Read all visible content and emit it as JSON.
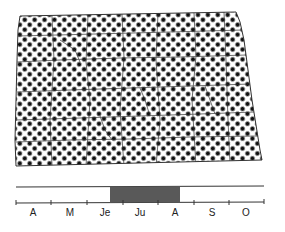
{
  "figure": {
    "type": "range-map",
    "region": "North Dakota (county outlines)",
    "map_fill_pattern": "halftone-dots",
    "colors": {
      "dot": "#111111",
      "background": "#ffffff",
      "outline": "#333333",
      "bar_fill": "#595959",
      "timeline_line": "#333333"
    }
  },
  "timeline": {
    "months": [
      {
        "label": "A",
        "x": 33
      },
      {
        "label": "M",
        "x": 70
      },
      {
        "label": "Je",
        "x": 105
      },
      {
        "label": "Ju",
        "x": 140
      },
      {
        "label": "A",
        "x": 175
      },
      {
        "label": "S",
        "x": 212
      },
      {
        "label": "O",
        "x": 246
      }
    ],
    "highlight": {
      "start_month": "Je",
      "end_month": "A",
      "x_start": 110,
      "x_end": 180
    }
  }
}
